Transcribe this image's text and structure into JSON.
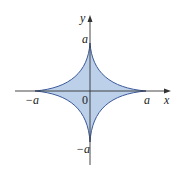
{
  "diagram": {
    "type": "astroid",
    "colors": {
      "fill": "#bcd0ea",
      "stroke": "#3b5a9a",
      "axis": "#333333"
    },
    "labels": {
      "y_axis": "y",
      "x_axis": "x",
      "top": "a",
      "right": "a",
      "left": "−a",
      "bottom": "−a",
      "origin": "0"
    }
  }
}
